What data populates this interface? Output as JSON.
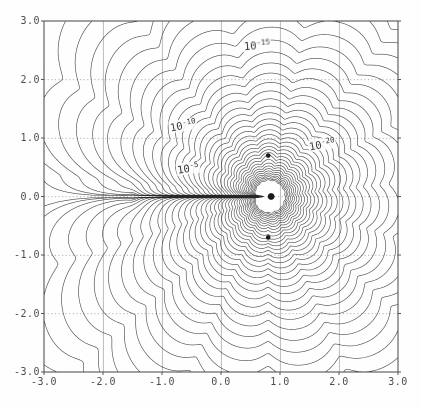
{
  "chart_data": {
    "type": "contour",
    "title": "",
    "xlabel": "",
    "ylabel": "",
    "xlim": [
      -3,
      3
    ],
    "ylim": [
      -3,
      3
    ],
    "grid": {
      "step": 1.0,
      "style": "dotted",
      "color": "#9a9a9a"
    },
    "x_tick_labels": [
      "-3.0",
      "-2.0",
      "-1.0",
      "0.0",
      "1.0",
      "2.0",
      "3.0"
    ],
    "y_tick_labels": [
      "3.0",
      "2.0",
      "1.0",
      "0.0",
      "-1.0",
      "-2.0",
      "-3.0"
    ],
    "labeled_levels": [
      "1e-5",
      "1e-10",
      "1e-15",
      "1e-20"
    ],
    "contour_labels": [
      {
        "base": "10",
        "exp": "-5",
        "x": -0.56,
        "y": 0.49,
        "rot": -8
      },
      {
        "base": "10",
        "exp": "-10",
        "x": -0.64,
        "y": 1.22,
        "rot": -10
      },
      {
        "base": "10",
        "exp": "-15",
        "x": 0.61,
        "y": 2.59,
        "rot": -4
      },
      {
        "base": "10",
        "exp": "-20",
        "x": 1.71,
        "y": 0.9,
        "rot": -10
      }
    ],
    "sources": [
      {
        "x": 0.8,
        "y": 0.7,
        "marker_px": 2.3
      },
      {
        "x": 0.85,
        "y": 0.0,
        "marker_px": 3.4
      },
      {
        "x": 0.8,
        "y": -0.7,
        "marker_px": 2.3
      }
    ],
    "zero_point": {
      "x": -1.5,
      "y": 0.0
    },
    "levels_log10": {
      "min": -24,
      "max": 14,
      "step": 1
    },
    "line_color": "#2d2d2d",
    "frame_color": "#555555",
    "model": {
      "amplitude_log10": 3.5,
      "zero_order": 2,
      "zero_ref_dist": 2.3,
      "cluster_center": {
        "x": 0.8,
        "y": 0.0
      },
      "cluster_order": 27,
      "cluster_radius": 0.7,
      "crease_weight": 1.5,
      "lobe_weight": 1.2,
      "lobe_freq": 7.5,
      "lobe_floor": 0.16
    }
  }
}
